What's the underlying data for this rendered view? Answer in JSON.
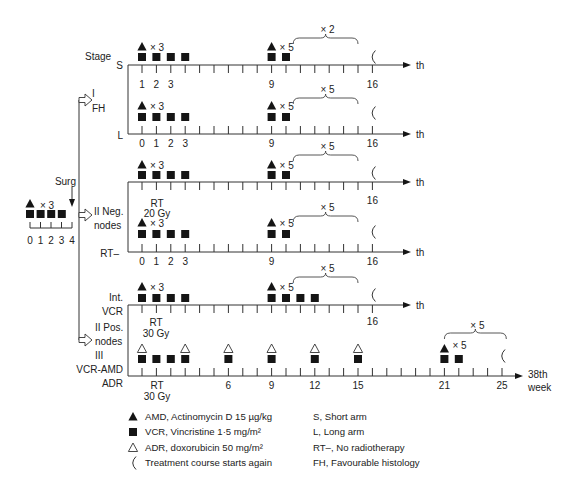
{
  "figure": {
    "stage_label": "Stage",
    "surgery_label": "Surg",
    "pre_surgery": {
      "amd_mult": "× 3",
      "vcr_weeks": [
        0,
        1,
        2,
        3
      ],
      "tick_labels": [
        "0",
        "1",
        "2",
        "3",
        "4"
      ]
    },
    "branches": [
      {
        "label": [
          "I",
          "FH"
        ]
      },
      {
        "label": [
          "II Neg.",
          "nodes"
        ]
      },
      {
        "label": [
          "II Pos.",
          "nodes",
          "III"
        ]
      }
    ],
    "timelines": [
      {
        "arm_label": [
          "S"
        ],
        "last_tick": 16,
        "end_label": [
          "th"
        ],
        "tick_labels": [
          {
            "week": 0,
            "text": "1"
          },
          {
            "week": 1,
            "text": "2"
          },
          {
            "week": 2,
            "text": "3"
          },
          {
            "week": 9,
            "text": "9"
          },
          {
            "week": 16,
            "text": "16"
          }
        ],
        "amd": [
          {
            "week": 0,
            "mult": "× 3"
          },
          {
            "week": 9,
            "mult": "× 5"
          }
        ],
        "vcr": [
          0,
          1,
          2,
          3,
          9,
          10
        ],
        "adr": [],
        "brace": {
          "from": 10.5,
          "to": 15,
          "label": "× 2"
        },
        "restart_week": 16
      },
      {
        "arm_label": [
          "L"
        ],
        "last_tick": 16,
        "end_label": [
          "th"
        ],
        "tick_labels": [
          {
            "week": 0,
            "text": "0"
          },
          {
            "week": 1,
            "text": "1"
          },
          {
            "week": 2,
            "text": "2"
          },
          {
            "week": 3,
            "text": "3"
          },
          {
            "week": 9,
            "text": "9"
          },
          {
            "week": 16,
            "text": "16"
          }
        ],
        "amd": [
          {
            "week": 0,
            "mult": "× 3"
          },
          {
            "week": 9,
            "mult": "× 5"
          }
        ],
        "vcr": [
          0,
          1,
          2,
          3,
          9,
          10
        ],
        "adr": [],
        "brace": {
          "from": 10.5,
          "to": 15,
          "label": "× 5"
        },
        "restart_week": 16
      },
      {
        "arm_label": [],
        "last_tick": 16,
        "end_label": [
          "th"
        ],
        "tick_labels": [
          {
            "week": 16,
            "text": "16"
          }
        ],
        "amd": [
          {
            "week": 0,
            "mult": "× 3"
          },
          {
            "week": 9,
            "mult": "× 5"
          }
        ],
        "vcr": [
          0,
          1,
          2,
          3,
          9,
          10
        ],
        "adr": [],
        "brace": {
          "from": 10.5,
          "to": 15,
          "label": "× 5"
        },
        "restart_week": 16
      },
      {
        "arm_label": [
          "RT–"
        ],
        "last_tick": 16,
        "end_label": [
          "th"
        ],
        "tick_labels": [
          {
            "week": 0,
            "text": "0"
          },
          {
            "week": 1,
            "text": "1"
          },
          {
            "week": 2,
            "text": "2"
          },
          {
            "week": 3,
            "text": "3"
          },
          {
            "week": 9,
            "text": "9"
          },
          {
            "week": 16,
            "text": "16"
          }
        ],
        "amd": [
          {
            "week": 0,
            "mult": "× 3"
          },
          {
            "week": 9,
            "mult": "× 5"
          }
        ],
        "vcr": [
          0,
          1,
          2,
          3,
          9,
          10
        ],
        "adr": [],
        "brace": {
          "from": 10.5,
          "to": 15,
          "label": "× 5"
        },
        "restart_week": 16
      },
      {
        "arm_label": [
          "Int.",
          "VCR"
        ],
        "last_tick": 16,
        "end_label": [
          "th"
        ],
        "tick_labels": [
          {
            "week": 16,
            "text": "16"
          }
        ],
        "amd": [
          {
            "week": 0,
            "mult": "× 3"
          },
          {
            "week": 9,
            "mult": "× 5"
          }
        ],
        "vcr": [
          0,
          1,
          2,
          3,
          9,
          10,
          11,
          12
        ],
        "adr": [],
        "brace": {
          "from": 10.5,
          "to": 15,
          "label": "× 5"
        },
        "restart_week": 16
      },
      {
        "arm_label": [
          "VCR-AMD",
          "ADR"
        ],
        "last_tick": 25,
        "end_label": [
          "38th",
          "week"
        ],
        "tick_labels": [
          {
            "week": 6,
            "text": "6"
          },
          {
            "week": 9,
            "text": "9"
          },
          {
            "week": 12,
            "text": "12"
          },
          {
            "week": 15,
            "text": "15"
          },
          {
            "week": 21,
            "text": "21"
          },
          {
            "week": 25,
            "text": "25"
          }
        ],
        "amd": [
          {
            "week": 21,
            "mult": "× 5"
          }
        ],
        "vcr": [
          0,
          1,
          2,
          3,
          6,
          9,
          12,
          15,
          21,
          22
        ],
        "adr": [
          0,
          3,
          6,
          9,
          12,
          15
        ],
        "brace": {
          "from": 21,
          "to": 25.3,
          "label": "× 5"
        },
        "restart_week": 25
      }
    ],
    "annotations": [
      {
        "lines": [
          "RT",
          "20 Gy"
        ]
      },
      {
        "lines": [
          "RT",
          "30 Gy"
        ]
      },
      {
        "lines": [
          "RT",
          "30 Gy"
        ]
      }
    ]
  },
  "legend": {
    "drugs": [
      {
        "icon": "filled-triangle-icon",
        "text": "AMD, Actinomycin D 15 µg/kg"
      },
      {
        "icon": "filled-square-icon",
        "text": "VCR, Vincristine 1·5 mg/m²"
      },
      {
        "icon": "open-triangle-icon",
        "text": "ADR, doxorubicin 50 mg/m²"
      },
      {
        "icon": "restart-bracket-icon",
        "text": "Treatment course starts again"
      }
    ],
    "abbreviations": [
      "S, Short arm",
      "L, Long arm",
      "RT–, No radiotherapy",
      "FH, Favourable histology"
    ]
  }
}
